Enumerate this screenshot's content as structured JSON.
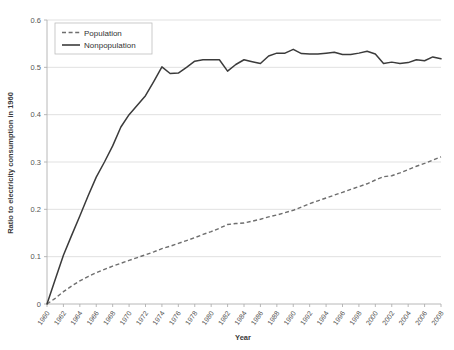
{
  "chart_data": {
    "type": "line",
    "title": "",
    "xlabel": "Year",
    "ylabel": "Ratio to electricity consumption in 1960",
    "xlim": [
      1960,
      2008
    ],
    "ylim": [
      0,
      0.6
    ],
    "grid": true,
    "legend_position": "top-left",
    "ytick_labels": [
      "0",
      "0.1",
      "0.2",
      "0.3",
      "0.4",
      "0.5",
      "0.6"
    ],
    "ytick_values": [
      0,
      0.1,
      0.2,
      0.3,
      0.4,
      0.5,
      0.6
    ],
    "xtick_labels": [
      "1960",
      "1962",
      "1964",
      "1966",
      "1968",
      "1970",
      "1972",
      "1974",
      "1976",
      "1978",
      "1980",
      "1982",
      "1984",
      "1986",
      "1988",
      "1990",
      "1992",
      "1994",
      "1996",
      "1998",
      "2000",
      "2002",
      "2004",
      "2006",
      "2008"
    ],
    "xtick_values": [
      1960,
      1962,
      1964,
      1966,
      1968,
      1970,
      1972,
      1974,
      1976,
      1978,
      1980,
      1982,
      1984,
      1986,
      1988,
      1990,
      1992,
      1994,
      1996,
      1998,
      2000,
      2002,
      2004,
      2006,
      2008
    ],
    "x": [
      1960,
      1961,
      1962,
      1963,
      1964,
      1965,
      1966,
      1967,
      1968,
      1969,
      1970,
      1971,
      1972,
      1973,
      1974,
      1975,
      1976,
      1977,
      1978,
      1979,
      1980,
      1981,
      1982,
      1983,
      1984,
      1985,
      1986,
      1987,
      1988,
      1989,
      1990,
      1991,
      1992,
      1993,
      1994,
      1995,
      1996,
      1997,
      1998,
      1999,
      2000,
      2001,
      2002,
      2003,
      2004,
      2005,
      2006,
      2007,
      2008
    ],
    "series": [
      {
        "name": "Population",
        "style": "dashed",
        "color": "#6e6e6e",
        "values": [
          0.0,
          0.012,
          0.026,
          0.038,
          0.049,
          0.058,
          0.066,
          0.073,
          0.08,
          0.086,
          0.092,
          0.098,
          0.104,
          0.11,
          0.117,
          0.122,
          0.128,
          0.134,
          0.14,
          0.147,
          0.153,
          0.16,
          0.168,
          0.17,
          0.171,
          0.175,
          0.179,
          0.184,
          0.188,
          0.193,
          0.198,
          0.205,
          0.212,
          0.218,
          0.224,
          0.23,
          0.236,
          0.242,
          0.248,
          0.254,
          0.262,
          0.269,
          0.271,
          0.277,
          0.284,
          0.291,
          0.297,
          0.304,
          0.311
        ]
      },
      {
        "name": "Nonpopulation",
        "style": "solid",
        "color": "#3b3b3b",
        "values": [
          0.0,
          0.052,
          0.103,
          0.145,
          0.186,
          0.228,
          0.268,
          0.3,
          0.334,
          0.374,
          0.4,
          0.42,
          0.44,
          0.47,
          0.501,
          0.487,
          0.488,
          0.5,
          0.513,
          0.516,
          0.516,
          0.516,
          0.492,
          0.506,
          0.516,
          0.512,
          0.508,
          0.524,
          0.53,
          0.53,
          0.538,
          0.529,
          0.528,
          0.528,
          0.53,
          0.532,
          0.527,
          0.527,
          0.53,
          0.534,
          0.528,
          0.508,
          0.511,
          0.508,
          0.51,
          0.516,
          0.514,
          0.522,
          0.518
        ]
      }
    ]
  }
}
